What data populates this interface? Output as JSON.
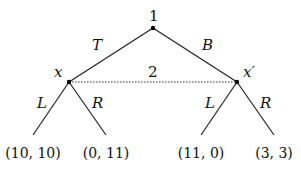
{
  "diagram": {
    "type": "extensive-form game tree",
    "root": {
      "player_label": "1",
      "x": 153,
      "y": 28
    },
    "actions_player1": [
      "T",
      "B"
    ],
    "info_set": {
      "player_label": "2",
      "nodes": [
        "x",
        "x′"
      ],
      "style": "dotted"
    },
    "nodes": {
      "x": {
        "label": "x",
        "x": 69,
        "y": 82
      },
      "x_prime": {
        "label": "x′",
        "x": 237,
        "y": 82
      }
    },
    "actions_player2": {
      "left_node": [
        "L",
        "R"
      ],
      "right_node": [
        "L",
        "R"
      ]
    },
    "payoffs": [
      "(10, 10)",
      "(0, 11)",
      "(11, 0)",
      "(3, 3)"
    ]
  }
}
